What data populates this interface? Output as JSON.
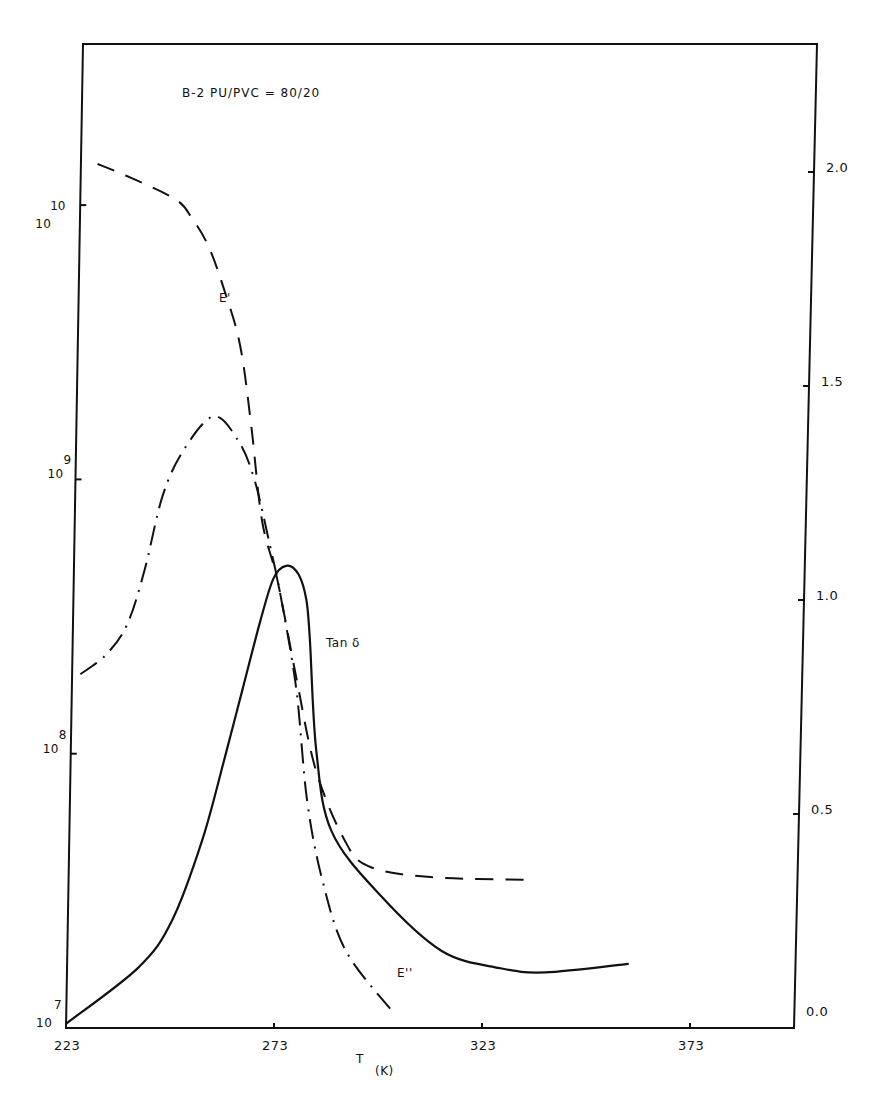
{
  "chart_data": {
    "type": "line",
    "title": "B-2 PU/PVC = 80/20",
    "xlabel": "T",
    "xlabel_unit": "(K)",
    "ylabel_left": "",
    "ylabel_right": "",
    "xlim": [
      223,
      398
    ],
    "ylim_left_log10": [
      7,
      10.55
    ],
    "ylim_right": [
      0.0,
      2.2
    ],
    "x_ticks": [
      223,
      273,
      323,
      373
    ],
    "y_left_ticks": [
      {
        "base": "10",
        "exp": "7",
        "value": 7
      },
      {
        "base": "10",
        "exp": "8",
        "value": 8
      },
      {
        "base": "10",
        "exp": "9",
        "value": 9
      },
      {
        "base": "10",
        "exp": "10",
        "value": 10
      }
    ],
    "y_right_ticks": [
      "0.0",
      "0.5",
      "1.0",
      "1.5",
      "2.0"
    ],
    "grid": false,
    "series": [
      {
        "name": "E'",
        "axis": "left-log",
        "style": "dashed",
        "label": "E'",
        "label_pos": [
          262,
          9.45
        ],
        "x": [
          227,
          235,
          246,
          250,
          254,
          258,
          262,
          265,
          268,
          272,
          277,
          282,
          289,
          295,
          310,
          335
        ],
        "log10_values": [
          10.15,
          10.1,
          10.02,
          9.95,
          9.85,
          9.69,
          9.49,
          9.2,
          8.85,
          8.63,
          8.27,
          7.94,
          7.69,
          7.59,
          7.55,
          7.54
        ]
      },
      {
        "name": "E''",
        "axis": "left-log",
        "style": "dash-dot",
        "label": "E''",
        "label_pos": [
          301,
          7.22
        ],
        "x": [
          225,
          231,
          236,
          240,
          244,
          249,
          256,
          262,
          266,
          270,
          273,
          277,
          280,
          284,
          290,
          302
        ],
        "log10_values": [
          8.29,
          8.36,
          8.47,
          8.67,
          8.94,
          9.11,
          9.23,
          9.14,
          9.0,
          8.76,
          8.56,
          8.23,
          7.83,
          7.54,
          7.28,
          7.05
        ]
      },
      {
        "name": "Tan δ",
        "axis": "right",
        "style": "solid",
        "label": "Tan δ",
        "label_pos": [
          286,
          0.87
        ],
        "x": [
          223,
          240,
          248,
          255,
          260,
          264,
          268,
          271,
          274,
          277,
          279,
          280,
          282,
          286,
          298,
          313,
          327,
          338,
          358
        ],
        "values": [
          0.01,
          0.14,
          0.25,
          0.44,
          0.63,
          0.79,
          0.95,
          1.05,
          1.08,
          1.06,
          1.0,
          0.91,
          0.65,
          0.46,
          0.31,
          0.18,
          0.14,
          0.13,
          0.15
        ]
      }
    ]
  },
  "labels": {
    "title": "B-2 PU/PVC = 80/20",
    "xlabel": "T",
    "xunit": "(K)",
    "e_prime": "E'",
    "e_double_prime": "E''",
    "tan_delta": "Tan δ"
  }
}
